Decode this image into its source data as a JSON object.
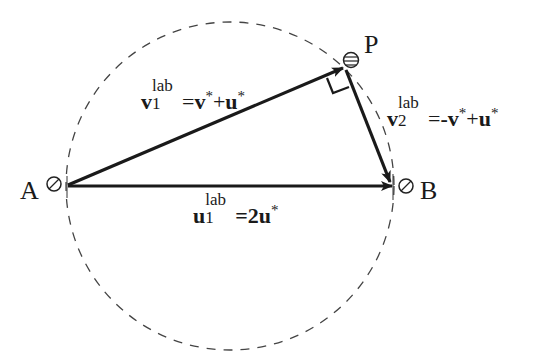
{
  "diagram": {
    "points": {
      "A": {
        "label": "A",
        "x": 67,
        "y": 186
      },
      "B": {
        "label": "B",
        "x": 393,
        "y": 186
      },
      "P": {
        "label": "P",
        "x": 348,
        "y": 62
      }
    },
    "circle": {
      "cx": 230,
      "cy": 186,
      "r": 164,
      "style": "dashed"
    },
    "vectors": [
      {
        "id": "v1lab",
        "from": "A",
        "to": "P",
        "label": {
          "base": "v",
          "sub": "1",
          "sup": "lab",
          "rhs": [
            "v",
            "*",
            "+",
            "u",
            "*"
          ],
          "equals": "="
        }
      },
      {
        "id": "v2lab",
        "from": "P",
        "to": "B",
        "label": {
          "base": "v",
          "sub": "2",
          "sup": "lab",
          "rhs": [
            "-v",
            "*",
            "+",
            "u",
            "*"
          ],
          "equals": "="
        }
      },
      {
        "id": "u1lab",
        "from": "A",
        "to": "B",
        "label": {
          "base": "u",
          "sub": "1",
          "sup": "lab",
          "rhs": [
            "2u",
            "*"
          ],
          "equals": "="
        }
      }
    ],
    "right_angle_at": "P",
    "colors": {
      "stroke": "#1a1a1a",
      "dash": "#444444",
      "background": "#ffffff"
    }
  }
}
